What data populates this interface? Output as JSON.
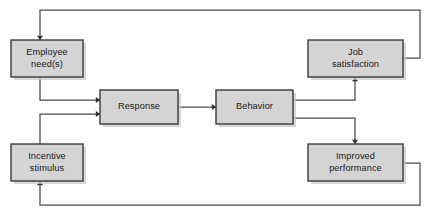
{
  "diagram": {
    "title": "Motivation process flow diagram",
    "type": "flowchart",
    "canvas": {
      "width": 426,
      "height": 214
    },
    "style": {
      "box_fill": "#d4d4d4",
      "box_stroke": "#3a3a3a",
      "shadow_color": "#c9c9c9",
      "line_color": "#4a4a4a",
      "arrow_color": "#2e2e2e",
      "text_color": "#1a1a1a",
      "background": "#ffffff"
    },
    "nodes": [
      {
        "id": "employee-needs",
        "name": "employee-needs-box",
        "lines": [
          "Employee",
          "need(s)"
        ],
        "x": 11,
        "y": 40,
        "w": 72,
        "h": 37
      },
      {
        "id": "incentive-stimulus",
        "name": "incentive-stimulus-box",
        "lines": [
          "Incentive",
          "stimulus"
        ],
        "x": 11,
        "y": 144,
        "w": 72,
        "h": 37
      },
      {
        "id": "response",
        "name": "response-box",
        "lines": [
          "Response"
        ],
        "x": 100,
        "y": 90,
        "w": 78,
        "h": 34
      },
      {
        "id": "behavior",
        "name": "behavior-box",
        "lines": [
          "Behavior"
        ],
        "x": 216,
        "y": 90,
        "w": 77,
        "h": 34
      },
      {
        "id": "job-satisfaction",
        "name": "job-satisfaction-box",
        "lines": [
          "Job",
          "satisfaction"
        ],
        "x": 308,
        "y": 40,
        "w": 95,
        "h": 37
      },
      {
        "id": "improved-performance",
        "name": "improved-performance-box",
        "lines": [
          "Improved",
          "performance"
        ],
        "x": 308,
        "y": 144,
        "w": 95,
        "h": 37
      }
    ],
    "connectors": [
      {
        "id": "needs-to-response",
        "name": "connector-employee-needs-to-response",
        "from": "employee-needs",
        "to": "response",
        "points": "40,77 40,100 100,100",
        "arrow": {
          "x": 100,
          "y": 100,
          "dir": "right"
        }
      },
      {
        "id": "incentive-to-response",
        "name": "connector-incentive-stimulus-to-response",
        "from": "incentive-stimulus",
        "to": "response",
        "points": "40,144 40,114 100,114",
        "arrow": {
          "x": 100,
          "y": 114,
          "dir": "right"
        }
      },
      {
        "id": "response-to-behavior",
        "name": "connector-response-to-behavior",
        "from": "response",
        "to": "behavior",
        "points": "178,107 216,107",
        "arrow": {
          "x": 216,
          "y": 107,
          "dir": "right"
        }
      },
      {
        "id": "behavior-to-job-satisfaction",
        "name": "connector-behavior-to-job-satisfaction",
        "from": "behavior",
        "to": "job-satisfaction",
        "points": "293,100 355,100 355,77",
        "arrow": {
          "x": 355,
          "y": 77,
          "dir": "up"
        }
      },
      {
        "id": "behavior-to-improved-performance",
        "name": "connector-behavior-to-improved-performance",
        "from": "behavior",
        "to": "improved-performance",
        "points": "293,118 355,118 355,144",
        "arrow": {
          "x": 355,
          "y": 144,
          "dir": "down"
        }
      },
      {
        "id": "job-satisfaction-feedback",
        "name": "connector-job-satisfaction-to-employee-needs-feedback",
        "from": "job-satisfaction",
        "to": "employee-needs",
        "points": "403,58 420,58 420,10 40,10 40,40",
        "arrow": {
          "x": 40,
          "y": 40,
          "dir": "down"
        }
      },
      {
        "id": "improved-performance-feedback",
        "name": "connector-improved-performance-to-incentive-stimulus-feedback",
        "from": "improved-performance",
        "to": "incentive-stimulus",
        "points": "403,163 420,163 420,205 40,205 40,181",
        "arrow": {
          "x": 40,
          "y": 181,
          "dir": "up"
        }
      }
    ]
  }
}
